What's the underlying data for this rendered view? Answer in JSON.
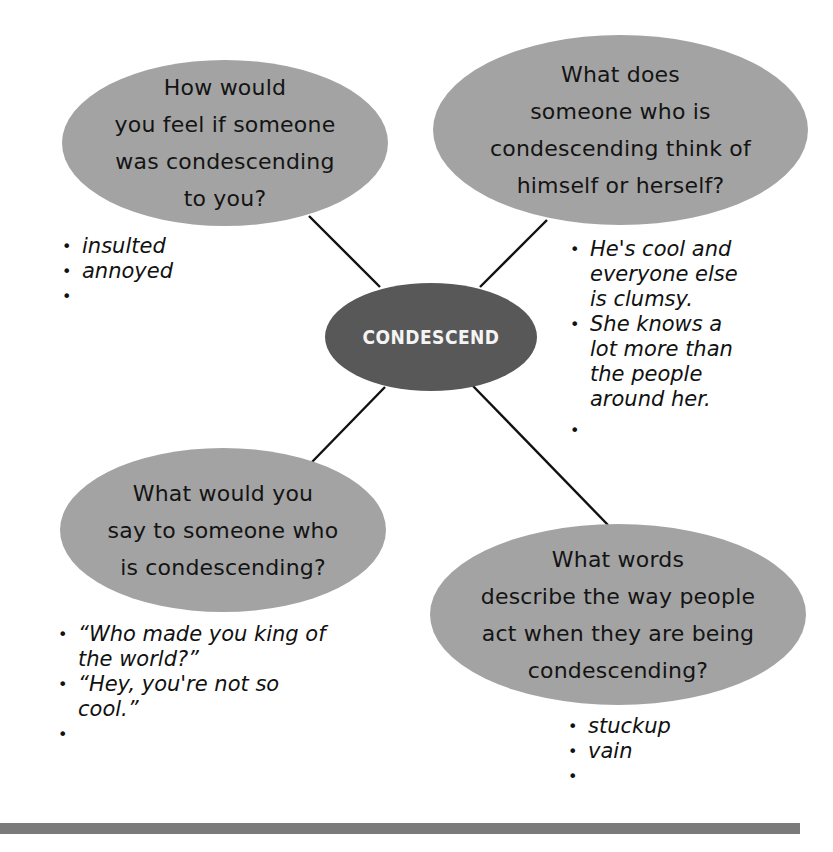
{
  "concept_map": {
    "center": {
      "term": "CONDESCEND",
      "fill": "#585858",
      "text_color": "#f4f4f4"
    },
    "node_fill": "#a3a3a3",
    "nodes": [
      {
        "id": "feel",
        "question": "How would\nyou feel if someone\nwas condescending\nto you?",
        "answers": [
          "insulted",
          "annoyed",
          ""
        ]
      },
      {
        "id": "self-view",
        "question": "What does\nsomeone who is\ncondescending think of\nhimself or herself?",
        "answers": [
          "He's cool and\neveryone else\nis clumsy.",
          "She knows a\nlot more than\nthe people\naround her.",
          ""
        ]
      },
      {
        "id": "say",
        "question": "What would you\nsay to someone who\nis condescending?",
        "answers": [
          "“Who made you king of\nthe world?”",
          "“Hey, you're not so\ncool.”",
          ""
        ]
      },
      {
        "id": "describe",
        "question": "What words\ndescribe the way people\nact when they are being\ncondescending?",
        "answers": [
          "stuckup",
          "vain",
          ""
        ]
      }
    ],
    "bullet_symbol": "•",
    "footer_rule_color": "#7a7a7a"
  }
}
